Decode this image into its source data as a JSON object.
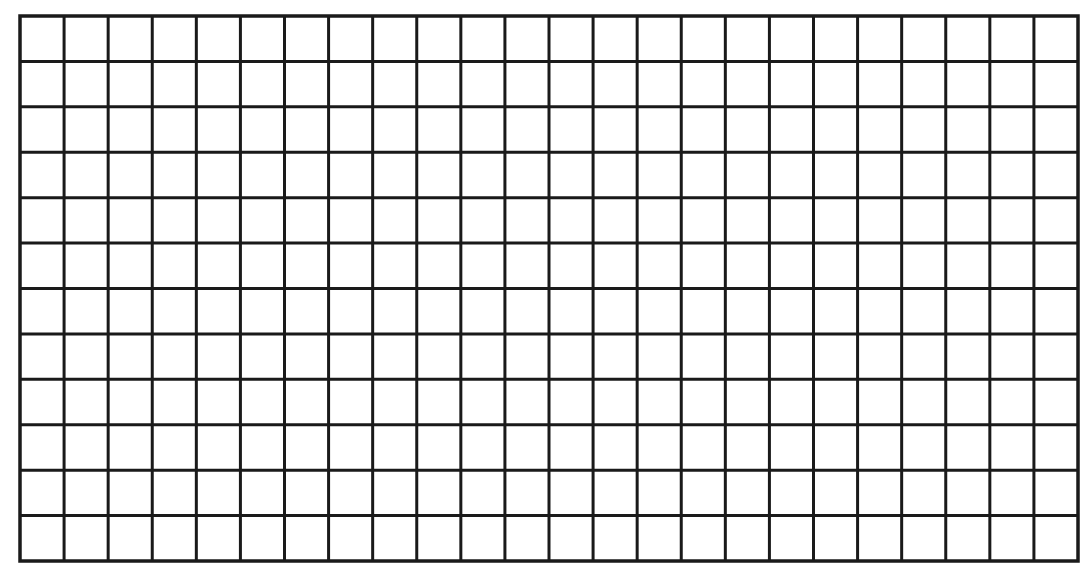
{
  "figure": {
    "kind": "blank grid",
    "columns": 24,
    "rows": 12,
    "line_color": "#1a1a1a",
    "background_color": "#ffffff",
    "line_width": 3,
    "border_width": 3.5,
    "origin": {
      "x": 20,
      "y": 16
    },
    "size": {
      "width": 1058,
      "height": 545
    }
  }
}
